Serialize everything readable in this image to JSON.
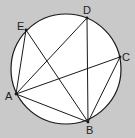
{
  "diagram": {
    "type": "inscribed-polygon-in-circle",
    "background_color": "#c9c9c9",
    "circle_fill": "#ffffff",
    "stroke_color": "#1a1a1a",
    "circle": {
      "cx": 66,
      "cy": 69,
      "r": 55
    },
    "points": {
      "A": {
        "x": 16,
        "y": 94,
        "label": "A",
        "lx": 5,
        "ly": 100
      },
      "B": {
        "x": 88,
        "y": 122,
        "label": "B",
        "lx": 86,
        "ly": 134
      },
      "C": {
        "x": 120,
        "y": 57,
        "label": "C",
        "lx": 122,
        "ly": 61
      },
      "D": {
        "x": 87,
        "y": 18,
        "label": "D",
        "lx": 83,
        "ly": 14
      },
      "E": {
        "x": 26,
        "y": 30,
        "label": "E",
        "lx": 17,
        "ly": 30
      }
    },
    "segments": [
      [
        "A",
        "E"
      ],
      [
        "A",
        "D"
      ],
      [
        "A",
        "C"
      ],
      [
        "A",
        "B"
      ],
      [
        "E",
        "B"
      ],
      [
        "D",
        "B"
      ],
      [
        "C",
        "B"
      ]
    ]
  }
}
